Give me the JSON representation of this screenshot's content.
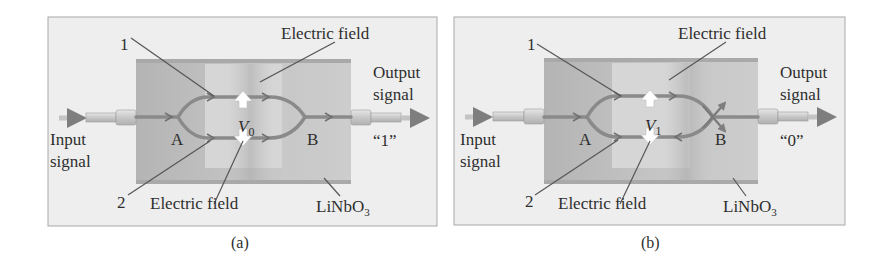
{
  "figure": {
    "panels": [
      {
        "id": "a",
        "caption": "(a)",
        "marker_1": "1",
        "marker_2": "2",
        "electric_field_top": "Electric field",
        "electric_field_bottom": "Electric field",
        "input_line1": "Input",
        "input_line2": "signal",
        "output_line1": "Output",
        "output_line2": "signal",
        "output_value": "“1”",
        "junction_a": "A",
        "junction_b": "B",
        "voltage_symbol": "V",
        "voltage_subscript": "0",
        "substrate": "LiNbO",
        "substrate_subscript": "3",
        "output_state": "constructive interference"
      },
      {
        "id": "b",
        "caption": "(b)",
        "marker_1": "1",
        "marker_2": "2",
        "electric_field_top": "Electric field",
        "electric_field_bottom": "Electric field",
        "input_line1": "Input",
        "input_line2": "signal",
        "output_line1": "Output",
        "output_line2": "signal",
        "output_value": "“0”",
        "junction_a": "A",
        "junction_b": "B",
        "voltage_symbol": "V",
        "voltage_subscript": "1",
        "substrate": "LiNbO",
        "substrate_subscript": "3",
        "output_state": "destructive interference"
      }
    ],
    "colors": {
      "frame_bg": "#eeeeee",
      "frame_border": "#a8a8a8",
      "chip": "#bdbdbd",
      "chip_edge": "#a9a9a9",
      "electrode": "#d6d6d6",
      "waveguide": "#8a8a8a",
      "leader": "#555555",
      "text": "#2e2e2e"
    }
  }
}
